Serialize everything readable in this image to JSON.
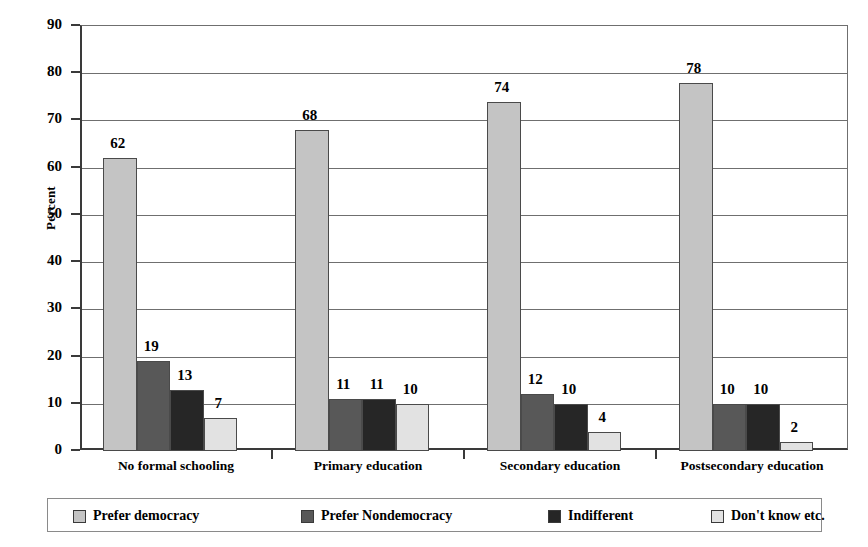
{
  "chart_data": {
    "type": "bar",
    "title": "",
    "xlabel": "",
    "ylabel": "Percent",
    "ylim": [
      0,
      90
    ],
    "ytick_step": 10,
    "grid": true,
    "legend_position": "bottom",
    "categories": [
      "No formal schooling",
      "Primary education",
      "Secondary education",
      "Postsecondary education"
    ],
    "ytick_labels": [
      "90",
      "80",
      "70",
      "60",
      "50",
      "40",
      "30",
      "20",
      "10",
      "0"
    ],
    "series": [
      {
        "name": "Prefer democracy",
        "color": "#c4c4c4",
        "values": [
          62,
          68,
          74,
          78
        ]
      },
      {
        "name": "Prefer Nondemocracy",
        "color": "#585858",
        "values": [
          19,
          11,
          12,
          10
        ]
      },
      {
        "name": "Indifferent",
        "color": "#262626",
        "values": [
          13,
          11,
          10,
          10
        ]
      },
      {
        "name": "Don't know etc.",
        "color": "#e2e2e2",
        "values": [
          7,
          10,
          4,
          2
        ]
      }
    ]
  },
  "legend": {
    "items": [
      {
        "label": "Prefer democracy",
        "swatch": "#c4c4c4"
      },
      {
        "label": "Prefer Nondemocracy",
        "swatch": "#585858"
      },
      {
        "label": "Indifferent",
        "swatch": "#262626"
      },
      {
        "label": "Don't know etc.",
        "swatch": "#e2e2e2"
      }
    ]
  }
}
